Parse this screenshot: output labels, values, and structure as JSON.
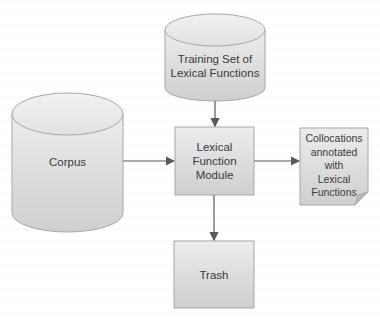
{
  "diagram": {
    "nodes": [
      {
        "id": "training_set",
        "shape": "cylinder",
        "label_lines": [
          "Training Set of",
          "Lexical Functions"
        ]
      },
      {
        "id": "corpus",
        "shape": "cylinder",
        "label_lines": [
          "Corpus"
        ]
      },
      {
        "id": "module",
        "shape": "rectangle",
        "label_lines": [
          "Lexical",
          "Function",
          "Module"
        ]
      },
      {
        "id": "output",
        "shape": "document",
        "label_lines": [
          "Collocations",
          "annotated",
          "with",
          "Lexical",
          "Functions"
        ]
      },
      {
        "id": "trash",
        "shape": "rectangle",
        "label_lines": [
          "Trash"
        ]
      }
    ],
    "edges": [
      {
        "from": "training_set",
        "to": "module"
      },
      {
        "from": "corpus",
        "to": "module"
      },
      {
        "from": "module",
        "to": "output"
      },
      {
        "from": "module",
        "to": "trash"
      }
    ],
    "colors": {
      "fill_light": "#ececec",
      "fill_dark": "#cfcfcf",
      "stroke": "#a6a6a6",
      "arrow": "#595959",
      "text": "#3a3a3a"
    }
  }
}
